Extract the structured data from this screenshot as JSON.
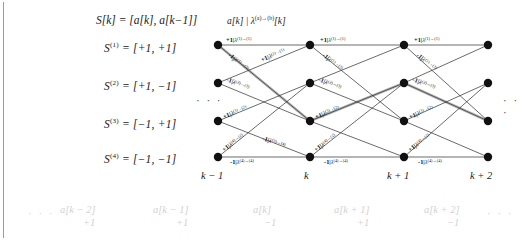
{
  "figure": {
    "type": "trellis-diagram",
    "title_equation": "S[k] = [a[k], a[k−1]]",
    "branch_header": "a[k] | λ(a)→(b)[k]",
    "colors": {
      "node": "#111111",
      "edge": "#2b2b2b",
      "highlight_path": "#b4b4b4",
      "faint_text": "#d2d2d2",
      "text": "#1a1a1a"
    }
  },
  "states": [
    {
      "name": "S(1)",
      "label": "S(1) = [+1, +1]",
      "sym": "S",
      "sup": "(1)",
      "value": "= [+1, +1]"
    },
    {
      "name": "S(2)",
      "label": "S(2) = [+1, −1]",
      "sym": "S",
      "sup": "(2)",
      "value": "= [+1, −1]"
    },
    {
      "name": "S(3)",
      "label": "S(3) = [−1, +1]",
      "sym": "S",
      "sup": "(3)",
      "value": "= [−1, +1]"
    },
    {
      "name": "S(4)",
      "label": "S(4) = [−1, −1]",
      "sym": "S",
      "sup": "(4)",
      "value": "= [−1, −1]"
    }
  ],
  "time_axis": {
    "labels": [
      "k − 1",
      "k",
      "k + 1",
      "k + 2"
    ],
    "left_ellipsis": "· · ·",
    "right_ellipsis": "· · ·"
  },
  "bottom_sequence": {
    "left_ellipsis": "· · ·",
    "right_ellipsis": "· · ·",
    "items": [
      {
        "symbol": "a[k − 2]",
        "value": "+1"
      },
      {
        "symbol": "a[k − 1]",
        "value": "+1"
      },
      {
        "symbol": "a[k]",
        "value": "−1"
      },
      {
        "symbol": "a[k + 1]",
        "value": "+1"
      },
      {
        "symbol": "a[k + 2]",
        "value": "−1"
      }
    ]
  },
  "branch_labels": {
    "s1_s1": {
      "input": "+1",
      "lambda": "λ",
      "transition": "(1)→(1)"
    },
    "s1_s3": {
      "input": "−1",
      "lambda": "λ",
      "transition": "(1)→(3)"
    },
    "s2_s1": {
      "input": "+1",
      "lambda": "λ",
      "transition": "(2)→(1)"
    },
    "s2_s3": {
      "input": "−1",
      "lambda": "λ",
      "transition": "(2)→(3)"
    },
    "s3_s2": {
      "input": "+1",
      "lambda": "λ",
      "transition": "(3)→(2)"
    },
    "s3_s4": {
      "input": "−1",
      "lambda": "λ",
      "transition": "(3)→(4)"
    },
    "s4_s2": {
      "input": "+1",
      "lambda": "λ",
      "transition": "(4)→(2)"
    },
    "s4_s4": {
      "input": "−1",
      "lambda": "λ",
      "transition": "(4)→(4)"
    }
  },
  "highlighted_path": {
    "description": "survivor path",
    "nodes": [
      {
        "time": "k − 1",
        "state": "S(1)"
      },
      {
        "time": "k",
        "state": "S(3)"
      },
      {
        "time": "k + 1",
        "state": "S(2)"
      },
      {
        "time": "k + 2",
        "state": "S(3)"
      }
    ]
  }
}
